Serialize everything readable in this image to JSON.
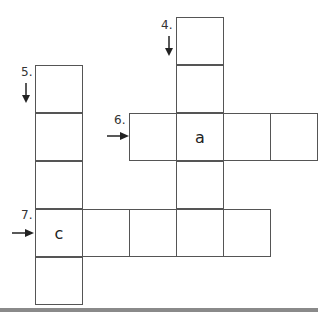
{
  "puzzle": {
    "clues": [
      {
        "number": "4.",
        "direction": "down",
        "length": 5
      },
      {
        "number": "5.",
        "direction": "down",
        "length": 5
      },
      {
        "number": "6.",
        "direction": "across",
        "length": 4
      },
      {
        "number": "7.",
        "direction": "across",
        "length": 5
      }
    ],
    "letters": {
      "clue6_cell2": "a",
      "clue7_cell1": "c"
    }
  }
}
